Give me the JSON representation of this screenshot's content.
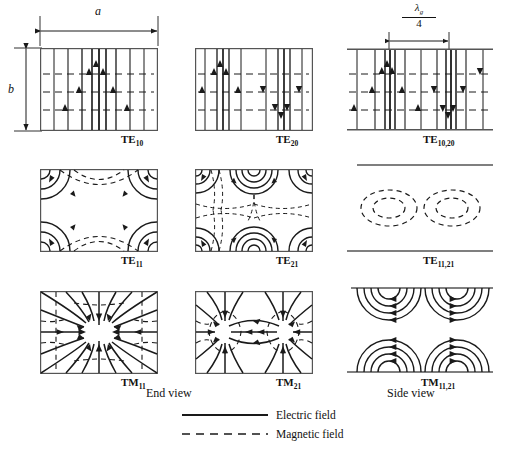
{
  "figure": {
    "dimension_labels": {
      "width_label": "a",
      "height_label": "b",
      "guide_quarter_numerator": "λ",
      "guide_quarter_numerator_sub": "g",
      "guide_quarter_denominator": "4"
    },
    "view_labels": {
      "end_view": "End view",
      "side_view": "Side view"
    },
    "legend": [
      {
        "style": "solid",
        "label": "Electric field"
      },
      {
        "style": "dashed",
        "label": "Magnetic field"
      }
    ],
    "colors": {
      "line": "#1a1a1a",
      "box": "#555555",
      "background": "#ffffff"
    },
    "cells": [
      {
        "id": "te10",
        "mode": "TE",
        "subscript": "10",
        "view": "end",
        "row": 1,
        "col": 1,
        "pattern": "parallel-vertical-e-lines-one-lobe",
        "description": "TE10 end view: vertical solid electric field lines with upward arrows, three horizontal dashed magnetic field lines"
      },
      {
        "id": "te20",
        "mode": "TE",
        "subscript": "20",
        "view": "end",
        "row": 1,
        "col": 2,
        "pattern": "parallel-vertical-e-lines-two-lobes",
        "description": "TE20 end view: two half-wave lobes, arrows up on left half and down on right half"
      },
      {
        "id": "te1020",
        "mode": "TE",
        "subscript": "10,20",
        "view": "side",
        "row": 1,
        "col": 3,
        "pattern": "longitudinal-alternating-lobes",
        "description": "TE10,20 side view: alternating up/down electric field lines along guide length spanning a quarter guide wavelength"
      },
      {
        "id": "te11",
        "mode": "TE",
        "subscript": "11",
        "view": "end",
        "row": 2,
        "col": 1,
        "pattern": "corner-arcs-single",
        "description": "TE11 end view: concentric solid arcs at the four corners with dashed magnetic arcs between"
      },
      {
        "id": "te21",
        "mode": "TE",
        "subscript": "21",
        "view": "end",
        "row": 2,
        "col": 2,
        "pattern": "corner-arcs-double",
        "description": "TE21 end view: corner arcs plus concentric semicircle groups at top centre and bottom centre"
      },
      {
        "id": "te1121",
        "mode": "TE",
        "subscript": "11,21",
        "view": "side",
        "row": 2,
        "col": 3,
        "pattern": "dashed-ellipse-pairs",
        "description": "TE11,21 side view: two pairs of dashed concentric ellipses between the guide walls"
      },
      {
        "id": "tm11",
        "mode": "TM",
        "subscript": "11",
        "view": "end",
        "row": 3,
        "col": 1,
        "pattern": "radial-single-centre",
        "description": "TM11 end view: solid electric field lines radiating inward to one central point with dashed closed magnetic loops"
      },
      {
        "id": "tm21",
        "mode": "TM",
        "subscript": "21",
        "view": "end",
        "row": 3,
        "col": 2,
        "pattern": "radial-two-centres",
        "description": "TM21 end view: two radial centres side by side with dashed magnetic loops around each"
      },
      {
        "id": "tm1121",
        "mode": "TM",
        "subscript": "11,21",
        "view": "side",
        "row": 3,
        "col": 3,
        "pattern": "semicircle-arc-groups",
        "description": "TM11,21 side view: groups of concentric semicircular electric field arcs on the upper and lower guide walls"
      }
    ]
  }
}
